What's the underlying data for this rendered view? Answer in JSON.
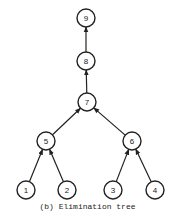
{
  "caption": "(b) Elimination tree",
  "nodes": [
    {
      "id": "9",
      "x": 86,
      "y": 18
    },
    {
      "id": "8",
      "x": 86,
      "y": 61
    },
    {
      "id": "7",
      "x": 87,
      "y": 102
    },
    {
      "id": "5",
      "x": 46,
      "y": 141
    },
    {
      "id": "6",
      "x": 132,
      "y": 141
    },
    {
      "id": "1",
      "x": 26,
      "y": 190
    },
    {
      "id": "2",
      "x": 67,
      "y": 190
    },
    {
      "id": "3",
      "x": 113,
      "y": 190
    },
    {
      "id": "4",
      "x": 155,
      "y": 190
    }
  ],
  "edges": [
    {
      "from": "8",
      "to": "9"
    },
    {
      "from": "7",
      "to": "8"
    },
    {
      "from": "5",
      "to": "7"
    },
    {
      "from": "6",
      "to": "7"
    },
    {
      "from": "1",
      "to": "5"
    },
    {
      "from": "2",
      "to": "5"
    },
    {
      "from": "3",
      "to": "6"
    },
    {
      "from": "4",
      "to": "6"
    }
  ],
  "style": {
    "stroke": "#222222",
    "node_radius": 9
  }
}
